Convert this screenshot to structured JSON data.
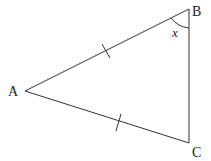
{
  "diagram": {
    "type": "isosceles-triangle",
    "vertices": {
      "A": {
        "label": "A",
        "x": 25,
        "y": 91
      },
      "B": {
        "label": "B",
        "x": 189,
        "y": 9
      },
      "C": {
        "label": "C",
        "x": 189,
        "y": 143
      }
    },
    "equal_sides": [
      "AB",
      "AC"
    ],
    "angle_label": {
      "at": "B",
      "text": "x"
    },
    "stroke_color": "#333333"
  }
}
